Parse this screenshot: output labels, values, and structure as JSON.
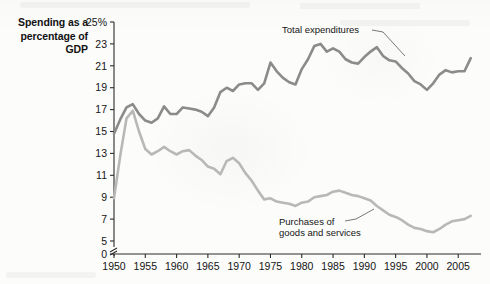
{
  "chart_data": {
    "type": "line",
    "title": "",
    "ylabel": "Spending as a percentage of GDP",
    "xlabel": "",
    "ylim": [
      0,
      25
    ],
    "xlim": [
      1950,
      2008
    ],
    "grid": false,
    "legend_position": "inline-annotations",
    "y_tick_labels": [
      "25%",
      "23",
      "21",
      "19",
      "17",
      "15",
      "13",
      "11",
      "9",
      "7",
      "5",
      "0"
    ],
    "y_tick_values": [
      25,
      23,
      21,
      19,
      17,
      15,
      13,
      11,
      9,
      7,
      5,
      0
    ],
    "axis_break": true,
    "axis_break_between": [
      0,
      5
    ],
    "x_tick_labels": [
      "1950",
      "1955",
      "1960",
      "1965",
      "1970",
      "1975",
      "1980",
      "1985",
      "1990",
      "1995",
      "2000",
      "2005"
    ],
    "x_tick_values": [
      1950,
      1955,
      1960,
      1965,
      1970,
      1975,
      1980,
      1985,
      1990,
      1995,
      2000,
      2005
    ],
    "x": [
      1950,
      1951,
      1952,
      1953,
      1954,
      1955,
      1956,
      1957,
      1958,
      1959,
      1960,
      1961,
      1962,
      1963,
      1964,
      1965,
      1966,
      1967,
      1968,
      1969,
      1970,
      1971,
      1972,
      1973,
      1974,
      1975,
      1976,
      1977,
      1978,
      1979,
      1980,
      1981,
      1982,
      1983,
      1984,
      1985,
      1986,
      1987,
      1988,
      1989,
      1990,
      1991,
      1992,
      1993,
      1994,
      1995,
      1996,
      1997,
      1998,
      1999,
      2000,
      2001,
      2002,
      2003,
      2004,
      2005,
      2006,
      2007
    ],
    "series": [
      {
        "name": "Total expenditures",
        "color": "#8b8b8b",
        "label_text": "Total expenditures",
        "values": [
          14.8,
          16.1,
          17.2,
          17.5,
          16.6,
          16.0,
          15.8,
          16.2,
          17.3,
          16.6,
          16.6,
          17.2,
          17.1,
          17.0,
          16.8,
          16.4,
          17.2,
          18.6,
          19.0,
          18.7,
          19.3,
          19.4,
          19.4,
          18.8,
          19.4,
          21.3,
          20.5,
          19.9,
          19.5,
          19.3,
          20.7,
          21.6,
          22.8,
          23.0,
          22.3,
          22.6,
          22.3,
          21.6,
          21.3,
          21.2,
          21.8,
          22.3,
          22.7,
          21.9,
          21.5,
          21.4,
          20.8,
          20.3,
          19.6,
          19.3,
          18.8,
          19.4,
          20.2,
          20.6,
          20.4,
          20.5,
          20.5,
          21.7
        ]
      },
      {
        "name": "Purchases of goods and services",
        "color": "#b8b8b8",
        "label_text": "Purchases of goods and services",
        "values": [
          8.9,
          12.8,
          16.2,
          16.9,
          15.0,
          13.4,
          12.9,
          13.2,
          13.6,
          13.2,
          12.9,
          13.2,
          13.3,
          12.8,
          12.4,
          11.8,
          11.6,
          11.1,
          12.3,
          12.6,
          12.1,
          11.2,
          10.5,
          9.6,
          8.8,
          8.9,
          8.6,
          8.5,
          8.4,
          8.2,
          8.5,
          8.6,
          9.0,
          9.1,
          9.2,
          9.5,
          9.6,
          9.4,
          9.2,
          9.1,
          8.9,
          8.7,
          8.2,
          7.8,
          7.4,
          7.2,
          6.9,
          6.5,
          6.2,
          6.1,
          5.9,
          5.8,
          6.1,
          6.5,
          6.8,
          6.9,
          7.0,
          7.3
        ]
      }
    ]
  },
  "annotations": {
    "total": {
      "line1": "Total expenditures"
    },
    "purchases": {
      "line1": "Purchases of",
      "line2": "goods and services"
    }
  }
}
